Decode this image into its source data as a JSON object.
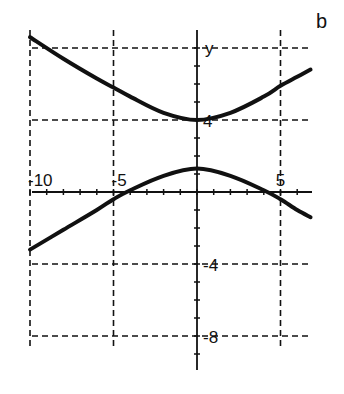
{
  "panel_label": "b",
  "chart_data": {
    "type": "line",
    "title": "",
    "xlabel": "",
    "ylabel": "y",
    "xlim": [
      -10,
      7
    ],
    "ylim": [
      -10.5,
      8.5
    ],
    "x_ticks": [
      -10,
      -5,
      5
    ],
    "x_tick_labels": [
      "-10",
      "-5",
      "5"
    ],
    "y_ticks": [
      4,
      -4,
      -8
    ],
    "y_tick_labels": [
      "4",
      "-4",
      "-8"
    ],
    "grid": {
      "style": "dashed",
      "x": [
        -10,
        -5,
        5
      ],
      "y": [
        8,
        4,
        -4,
        -8
      ]
    },
    "legend": null,
    "series": [
      {
        "name": "upper branch",
        "x": [
          -10,
          -8,
          -6,
          -5,
          -4,
          -2,
          0,
          2,
          4,
          5,
          6,
          6.8
        ],
        "y": [
          8.6,
          7.4,
          6.3,
          5.8,
          5.3,
          4.4,
          4.0,
          4.4,
          5.3,
          5.9,
          6.4,
          6.8
        ]
      },
      {
        "name": "lower branch",
        "x": [
          -10,
          -8,
          -6,
          -5,
          -4,
          -2,
          0,
          2,
          4,
          5,
          6,
          6.8
        ],
        "y": [
          -3.2,
          -2.1,
          -1.0,
          -0.4,
          0.1,
          0.9,
          1.3,
          0.9,
          0.1,
          -0.4,
          -1.0,
          -1.4
        ]
      }
    ]
  }
}
